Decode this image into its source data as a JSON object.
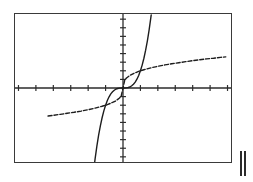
{
  "figure": {
    "background_color": "#ffffff",
    "frame": {
      "border_color": "#3a3a3a",
      "fill_color": "#ffffff",
      "x": 14,
      "y": 13,
      "width": 218,
      "height": 150
    },
    "mark": {
      "label": "||",
      "color": "#2b2b2b",
      "x": 240,
      "y": 151,
      "width": 8,
      "height": 25
    }
  },
  "chart_data": {
    "type": "line",
    "title": "",
    "subtitle": "",
    "xlabel": "",
    "ylabel": "",
    "xlim": [
      -6.2,
      6.2
    ],
    "ylim": [
      -4.3,
      4.3
    ],
    "grid": false,
    "legend_position": "none",
    "axes": {
      "x_axis": {
        "visible": true,
        "color": "#2b2b2b",
        "y_value": 0,
        "tick_spacing": 1,
        "tick_count": 12,
        "tick_length": 3,
        "tick_labels": []
      },
      "y_axis": {
        "visible": true,
        "color": "#2b2b2b",
        "x_value": 0,
        "tick_spacing": 0.5,
        "tick_count": 14,
        "tick_length": 3,
        "tick_labels": []
      }
    },
    "series": [
      {
        "name": "y = x^3",
        "style": "solid",
        "color": "#1d1d1d",
        "width": 1.4,
        "x": [
          -1.72,
          -1.6,
          -1.5,
          -1.4,
          -1.3,
          -1.2,
          -1.1,
          -1.0,
          -0.9,
          -0.8,
          -0.7,
          -0.6,
          -0.5,
          -0.4,
          -0.3,
          -0.2,
          -0.1,
          0.0,
          0.1,
          0.2,
          0.3,
          0.4,
          0.5,
          0.6,
          0.7,
          0.8,
          0.9,
          1.0,
          1.1,
          1.2,
          1.3,
          1.4,
          1.5,
          1.6,
          1.62
        ],
        "y": [
          -5.09,
          -4.1,
          -3.38,
          -2.74,
          -2.2,
          -1.73,
          -1.33,
          -1.0,
          -0.73,
          -0.51,
          -0.34,
          -0.22,
          -0.13,
          -0.06,
          -0.03,
          -0.01,
          0.0,
          0.0,
          0.0,
          0.01,
          0.03,
          0.06,
          0.13,
          0.22,
          0.34,
          0.51,
          0.73,
          1.0,
          1.33,
          1.73,
          2.2,
          2.74,
          3.38,
          4.1,
          4.25
        ]
      },
      {
        "name": "y = cube-root(x)",
        "style": "dashed",
        "color": "#1d1d1d",
        "width": 1.4,
        "dash_pattern": "4 2",
        "x": [
          -4.3,
          -4.0,
          -3.6,
          -3.2,
          -2.8,
          -2.4,
          -2.0,
          -1.6,
          -1.2,
          -0.9,
          -0.6,
          -0.4,
          -0.2,
          -0.1,
          0.0,
          0.1,
          0.2,
          0.4,
          0.6,
          0.9,
          1.2,
          1.6,
          2.0,
          2.4,
          2.8,
          3.2,
          3.6,
          4.0,
          4.4,
          4.8,
          5.2,
          5.6,
          5.9
        ],
        "y": [
          -1.63,
          -1.59,
          -1.53,
          -1.47,
          -1.41,
          -1.34,
          -1.26,
          -1.17,
          -1.06,
          -0.97,
          -0.84,
          -0.74,
          -0.58,
          -0.46,
          0.0,
          0.46,
          0.58,
          0.74,
          0.84,
          0.97,
          1.06,
          1.17,
          1.26,
          1.34,
          1.41,
          1.47,
          1.53,
          1.59,
          1.64,
          1.69,
          1.73,
          1.78,
          1.81
        ]
      }
    ]
  }
}
